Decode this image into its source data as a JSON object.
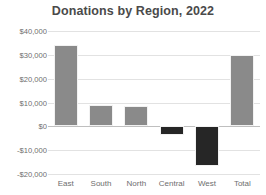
{
  "chart_data": {
    "type": "bar",
    "title": "Donations by Region, 2022",
    "xlabel": "",
    "ylabel": "",
    "categories": [
      "East",
      "South",
      "North",
      "Central",
      "West",
      "Total"
    ],
    "values": [
      34000,
      9000,
      8500,
      -3800,
      -16700,
      30000
    ],
    "bar_colors": [
      "#8a8a8a",
      "#8a8a8a",
      "#8a8a8a",
      "#262626",
      "#262626",
      "#8a8a8a"
    ],
    "ylim": [
      -20000,
      40000
    ],
    "ytick_values": [
      40000,
      30000,
      20000,
      10000,
      0,
      -10000,
      -20000
    ],
    "ytick_labels": [
      "$40,000",
      "$30,000",
      "$20,000",
      "$10,000",
      "$0",
      "-$10,000",
      "-$20,000"
    ],
    "grid": true,
    "legend": false,
    "positive_color": "#8a8a8a",
    "negative_color": "#262626",
    "grid_color": "#e2e2e2",
    "zero_line_color": "#bfbfbf"
  }
}
